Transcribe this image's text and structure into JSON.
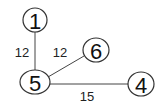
{
  "graph": {
    "nodes": [
      {
        "id": "1",
        "label": "1",
        "x": 35,
        "y": 20,
        "rx": 12,
        "ry": 12
      },
      {
        "id": "6",
        "label": "6",
        "x": 96,
        "y": 50,
        "rx": 13,
        "ry": 12
      },
      {
        "id": "5",
        "label": "5",
        "x": 35,
        "y": 82,
        "rx": 15,
        "ry": 12
      },
      {
        "id": "4",
        "label": "4",
        "x": 141,
        "y": 84,
        "rx": 13,
        "ry": 12
      }
    ],
    "edges": [
      {
        "from": "1",
        "to": "5",
        "weight": "12",
        "lx": 22,
        "ly": 52
      },
      {
        "from": "5",
        "to": "6",
        "weight": "12",
        "lx": 60,
        "ly": 52
      },
      {
        "from": "5",
        "to": "4",
        "weight": "15",
        "lx": 87,
        "ly": 95
      }
    ]
  }
}
